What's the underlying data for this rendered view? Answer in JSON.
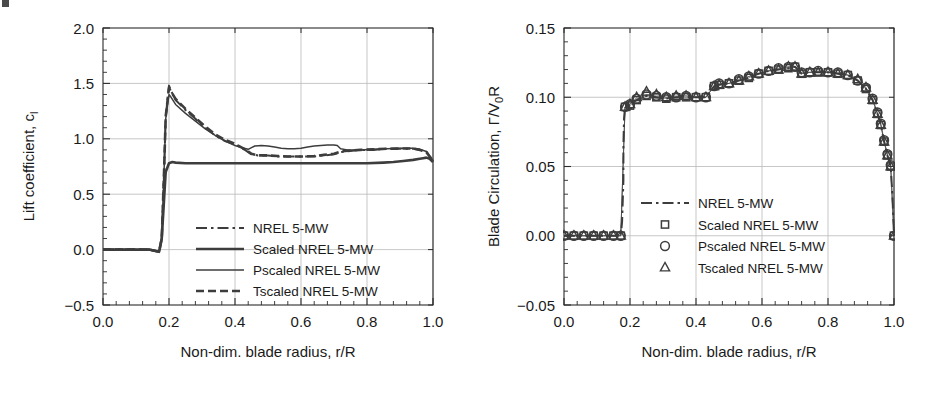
{
  "figure": {
    "background": "#ffffff",
    "ink_color": "#2b2b2b",
    "grid_color": "#b9b9b9",
    "series_color": "#3d3d3d"
  },
  "chart_data": [
    {
      "type": "line",
      "id": "lift-coefficient",
      "title": "",
      "xlabel": "Non-dim. blade radius, r/R",
      "ylabel": "Lift coefficient, c",
      "ylabel_sub": "l",
      "xlim": [
        0.0,
        1.0
      ],
      "ylim": [
        -0.5,
        2.0
      ],
      "xticks": [
        0.0,
        0.2,
        0.4,
        0.6,
        0.8,
        1.0
      ],
      "xtick_labels": [
        "0.0",
        "0.2",
        "0.4",
        "0.6",
        "0.8",
        "1.0"
      ],
      "yticks": [
        -0.5,
        0.0,
        0.5,
        1.0,
        1.5,
        2.0
      ],
      "ytick_labels": [
        "−0.5",
        "0.0",
        "0.5",
        "1.0",
        "1.5",
        "2.0"
      ],
      "minor_ticks_per_interval": 5,
      "grid": true,
      "legend_position": "lower-center-right",
      "series": [
        {
          "name": "NREL 5-MW",
          "style": "dash-dot",
          "x": [
            0.0,
            0.05,
            0.1,
            0.14,
            0.17,
            0.178,
            0.185,
            0.19,
            0.2,
            0.205,
            0.22,
            0.25,
            0.28,
            0.31,
            0.34,
            0.37,
            0.4,
            0.43,
            0.45,
            0.47,
            0.5,
            0.53,
            0.56,
            0.6,
            0.64,
            0.67,
            0.7,
            0.72,
            0.75,
            0.78,
            0.82,
            0.86,
            0.9,
            0.94,
            0.96,
            0.98,
            1.0
          ],
          "y": [
            0.0,
            0.0,
            0.0,
            0.0,
            -0.02,
            0.1,
            0.7,
            1.2,
            1.48,
            1.44,
            1.35,
            1.26,
            1.18,
            1.1,
            1.03,
            0.98,
            0.95,
            0.9,
            0.86,
            0.85,
            0.85,
            0.84,
            0.84,
            0.84,
            0.84,
            0.85,
            0.86,
            0.88,
            0.89,
            0.9,
            0.9,
            0.91,
            0.91,
            0.91,
            0.9,
            0.88,
            0.8
          ]
        },
        {
          "name": "Scaled NREL 5-MW",
          "style": "solid-thick",
          "x": [
            0.0,
            0.05,
            0.1,
            0.14,
            0.17,
            0.178,
            0.185,
            0.19,
            0.2,
            0.21,
            0.22,
            0.25,
            0.3,
            0.35,
            0.4,
            0.45,
            0.5,
            0.55,
            0.6,
            0.65,
            0.7,
            0.75,
            0.8,
            0.85,
            0.88,
            0.91,
            0.94,
            0.96,
            0.97,
            0.98,
            0.99,
            1.0
          ],
          "y": [
            0.0,
            0.0,
            0.0,
            0.0,
            -0.02,
            0.1,
            0.45,
            0.7,
            0.78,
            0.79,
            0.785,
            0.78,
            0.78,
            0.78,
            0.78,
            0.78,
            0.78,
            0.78,
            0.78,
            0.78,
            0.78,
            0.78,
            0.78,
            0.785,
            0.79,
            0.8,
            0.81,
            0.82,
            0.825,
            0.83,
            0.82,
            0.79
          ]
        },
        {
          "name": "Pscaled NREL 5-MW",
          "style": "solid-thin",
          "x": [
            0.0,
            0.05,
            0.1,
            0.14,
            0.17,
            0.178,
            0.185,
            0.19,
            0.2,
            0.205,
            0.22,
            0.25,
            0.28,
            0.31,
            0.34,
            0.37,
            0.4,
            0.42,
            0.44,
            0.45,
            0.46,
            0.48,
            0.5,
            0.52,
            0.54,
            0.56,
            0.58,
            0.6,
            0.62,
            0.64,
            0.66,
            0.68,
            0.7,
            0.71,
            0.72,
            0.74,
            0.78,
            0.82,
            0.86,
            0.9,
            0.94,
            0.96,
            0.98,
            1.0
          ],
          "y": [
            0.0,
            0.0,
            0.0,
            0.0,
            -0.02,
            0.1,
            0.7,
            1.18,
            1.4,
            1.38,
            1.31,
            1.23,
            1.16,
            1.09,
            1.03,
            0.98,
            0.94,
            0.92,
            0.905,
            0.92,
            0.935,
            0.94,
            0.935,
            0.925,
            0.915,
            0.91,
            0.91,
            0.915,
            0.925,
            0.935,
            0.94,
            0.945,
            0.945,
            0.94,
            0.91,
            0.9,
            0.9,
            0.905,
            0.91,
            0.915,
            0.915,
            0.905,
            0.885,
            0.8
          ]
        },
        {
          "name": "Tscaled NREL 5-MW",
          "style": "dashed",
          "x": [
            0.0,
            0.05,
            0.1,
            0.14,
            0.17,
            0.178,
            0.185,
            0.19,
            0.2,
            0.205,
            0.22,
            0.25,
            0.28,
            0.31,
            0.34,
            0.37,
            0.4,
            0.43,
            0.45,
            0.47,
            0.5,
            0.53,
            0.56,
            0.6,
            0.64,
            0.67,
            0.7,
            0.72,
            0.75,
            0.78,
            0.82,
            0.86,
            0.9,
            0.94,
            0.96,
            0.98,
            1.0
          ],
          "y": [
            0.0,
            0.0,
            0.0,
            0.0,
            -0.02,
            0.1,
            0.7,
            1.2,
            1.46,
            1.43,
            1.36,
            1.27,
            1.19,
            1.11,
            1.04,
            0.99,
            0.955,
            0.905,
            0.865,
            0.85,
            0.85,
            0.845,
            0.84,
            0.84,
            0.845,
            0.855,
            0.865,
            0.885,
            0.895,
            0.9,
            0.905,
            0.91,
            0.912,
            0.912,
            0.9,
            0.88,
            0.8
          ]
        }
      ]
    },
    {
      "type": "scatter",
      "id": "blade-circulation",
      "title": "",
      "xlabel": "Non-dim. blade radius, r/R",
      "ylabel": "Blade Circulation, Γ/V",
      "ylabel_sub": "0",
      "ylabel_tail": "R",
      "xlim": [
        0.0,
        1.0
      ],
      "ylim": [
        -0.05,
        0.15
      ],
      "xticks": [
        0.0,
        0.2,
        0.4,
        0.6,
        0.8,
        1.0
      ],
      "xtick_labels": [
        "0.0",
        "0.2",
        "0.4",
        "0.6",
        "0.8",
        "1.0"
      ],
      "yticks": [
        -0.05,
        0.0,
        0.05,
        0.1,
        0.15
      ],
      "ytick_labels": [
        "−0.05",
        "0.00",
        "0.05",
        "0.10",
        "0.15"
      ],
      "minor_ticks_per_interval": 5,
      "grid": true,
      "legend_position": "center",
      "series": [
        {
          "name": "NREL 5-MW",
          "style": "dash-dot",
          "marker": "none",
          "x": [
            0.0,
            0.03,
            0.06,
            0.09,
            0.12,
            0.15,
            0.172,
            0.176,
            0.18,
            0.18,
            0.182,
            0.185,
            0.19,
            0.22,
            0.25,
            0.28,
            0.31,
            0.34,
            0.37,
            0.4,
            0.43,
            0.455,
            0.47,
            0.5,
            0.53,
            0.56,
            0.59,
            0.62,
            0.65,
            0.68,
            0.7,
            0.72,
            0.745,
            0.77,
            0.8,
            0.83,
            0.86,
            0.89,
            0.915,
            0.935,
            0.95,
            0.96,
            0.97,
            0.98,
            0.99,
            0.995,
            1.0
          ],
          "y": [
            0.0,
            0.0,
            0.0,
            0.0,
            0.0,
            0.0,
            0.0,
            0.01,
            0.04,
            0.065,
            0.085,
            0.093,
            0.094,
            0.098,
            0.101,
            0.1,
            0.099,
            0.1,
            0.1,
            0.1,
            0.1,
            0.108,
            0.109,
            0.11,
            0.112,
            0.114,
            0.117,
            0.119,
            0.12,
            0.121,
            0.122,
            0.117,
            0.118,
            0.118,
            0.118,
            0.117,
            0.116,
            0.112,
            0.106,
            0.098,
            0.088,
            0.08,
            0.068,
            0.058,
            0.05,
            0.03,
            0.0
          ]
        },
        {
          "name": "Scaled NREL 5-MW",
          "style": "marker",
          "marker": "square",
          "x": [
            0.0,
            0.03,
            0.06,
            0.09,
            0.12,
            0.15,
            0.172,
            0.185,
            0.2,
            0.22,
            0.25,
            0.28,
            0.31,
            0.34,
            0.37,
            0.4,
            0.43,
            0.455,
            0.47,
            0.5,
            0.53,
            0.56,
            0.59,
            0.62,
            0.65,
            0.68,
            0.7,
            0.72,
            0.745,
            0.77,
            0.8,
            0.83,
            0.86,
            0.89,
            0.915,
            0.935,
            0.95,
            0.96,
            0.97,
            0.98,
            0.99,
            1.0
          ],
          "y": [
            0.0,
            0.0,
            0.0,
            0.0,
            0.0,
            0.0,
            0.0,
            0.093,
            0.094,
            0.098,
            0.101,
            0.1,
            0.099,
            0.1,
            0.1,
            0.1,
            0.1,
            0.108,
            0.109,
            0.11,
            0.112,
            0.114,
            0.117,
            0.119,
            0.12,
            0.121,
            0.122,
            0.117,
            0.118,
            0.118,
            0.118,
            0.117,
            0.116,
            0.112,
            0.106,
            0.098,
            0.088,
            0.08,
            0.068,
            0.058,
            0.05,
            0.0
          ]
        },
        {
          "name": "Pscaled NREL 5-MW",
          "style": "marker",
          "marker": "circle",
          "x": [
            0.0,
            0.03,
            0.06,
            0.09,
            0.12,
            0.15,
            0.172,
            0.185,
            0.2,
            0.22,
            0.25,
            0.28,
            0.31,
            0.34,
            0.37,
            0.4,
            0.43,
            0.455,
            0.47,
            0.5,
            0.53,
            0.56,
            0.59,
            0.62,
            0.65,
            0.68,
            0.7,
            0.72,
            0.745,
            0.77,
            0.8,
            0.83,
            0.86,
            0.89,
            0.915,
            0.935,
            0.95,
            0.96,
            0.97,
            0.98,
            0.99,
            1.0
          ],
          "y": [
            0.0,
            0.0,
            0.0,
            0.0,
            0.0,
            0.0,
            0.0,
            0.093,
            0.095,
            0.099,
            0.102,
            0.101,
            0.1,
            0.1,
            0.101,
            0.1,
            0.1,
            0.108,
            0.11,
            0.11,
            0.113,
            0.115,
            0.117,
            0.119,
            0.121,
            0.122,
            0.122,
            0.118,
            0.118,
            0.119,
            0.118,
            0.118,
            0.116,
            0.112,
            0.107,
            0.099,
            0.089,
            0.081,
            0.069,
            0.059,
            0.051,
            0.0
          ]
        },
        {
          "name": "Tscaled NREL 5-MW",
          "style": "marker",
          "marker": "triangle",
          "x": [
            0.0,
            0.03,
            0.06,
            0.09,
            0.12,
            0.15,
            0.172,
            0.185,
            0.2,
            0.22,
            0.25,
            0.28,
            0.31,
            0.34,
            0.37,
            0.4,
            0.43,
            0.455,
            0.47,
            0.5,
            0.53,
            0.56,
            0.59,
            0.62,
            0.65,
            0.68,
            0.7,
            0.72,
            0.745,
            0.77,
            0.8,
            0.83,
            0.86,
            0.89,
            0.915,
            0.935,
            0.95,
            0.96,
            0.97,
            0.98,
            0.99,
            1.0
          ],
          "y": [
            0.0,
            0.0,
            0.0,
            0.0,
            0.0,
            0.0,
            0.0,
            0.093,
            0.095,
            0.1,
            0.104,
            0.102,
            0.1,
            0.101,
            0.101,
            0.1,
            0.1,
            0.108,
            0.109,
            0.11,
            0.112,
            0.115,
            0.117,
            0.119,
            0.12,
            0.122,
            0.122,
            0.117,
            0.118,
            0.118,
            0.118,
            0.117,
            0.116,
            0.113,
            0.107,
            0.098,
            0.088,
            0.08,
            0.068,
            0.058,
            0.05,
            0.0
          ]
        }
      ]
    }
  ]
}
